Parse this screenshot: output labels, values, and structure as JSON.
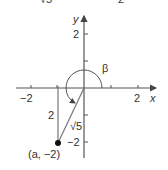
{
  "top_fragments": {
    "left": "√5",
    "right": "2"
  },
  "axes": {
    "x_label": "x",
    "y_label": "y",
    "x_ticks": [
      "−2",
      "2"
    ],
    "y_ticks": [
      "2",
      "−2"
    ]
  },
  "angle": {
    "label": "β"
  },
  "triangle": {
    "side_vertical": "2",
    "hypotenuse": "√5",
    "point_label": "(a, −2)"
  },
  "colors": {
    "line": "#444444",
    "light_line": "#888888",
    "point": "#111111"
  }
}
